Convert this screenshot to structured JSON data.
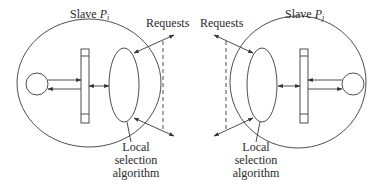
{
  "diagram": {
    "type": "distributed-load-balancing",
    "stroke_color": "#3a3a3a",
    "background": "#ffffff",
    "left": {
      "title_prefix": "Slave ",
      "title_var": "P",
      "title_sub": "i",
      "requests_label": "Requests",
      "algo_label_lines": [
        "Local",
        "selection",
        "algorithm"
      ]
    },
    "right": {
      "title_prefix": "Slave ",
      "title_var": "P",
      "title_sub": "j",
      "requests_label": "Requests",
      "algo_label_lines": [
        "Local",
        "selection",
        "algorithm"
      ]
    }
  }
}
